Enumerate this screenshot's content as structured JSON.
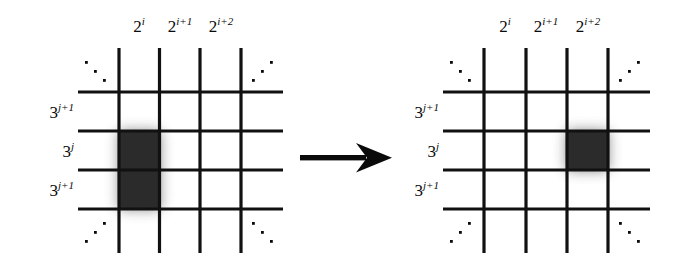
{
  "figure": {
    "caption": "",
    "type": "grid-transformation-diagram",
    "colors": {
      "ink": "#0a0a0a",
      "line": "#111111",
      "shaded_cell": "#2b2b2b",
      "background": "#ffffff"
    }
  },
  "arrow": {
    "name": "rightwards-transformation-arrow",
    "direction": "right",
    "label": ""
  },
  "panels": [
    {
      "id": "left",
      "name": "before-grid",
      "column_labels": [
        {
          "base": "2",
          "exp": "i",
          "text": "2^i"
        },
        {
          "base": "2",
          "exp": "i+1",
          "text": "2^{i+1}"
        },
        {
          "base": "2",
          "exp": "i+2",
          "text": "2^{i+2}"
        }
      ],
      "row_labels": [
        {
          "base": "3",
          "exp": "j+1",
          "text": "3^{j+1}"
        },
        {
          "base": "3",
          "exp": "j",
          "text": "3^{j}"
        },
        {
          "base": "3",
          "exp": "j+1",
          "text": "3^{j+1}"
        }
      ],
      "corner_ellipses": [
        {
          "position": "top-left",
          "slope": "down-right"
        },
        {
          "position": "top-right",
          "slope": "up-right"
        },
        {
          "position": "bottom-left",
          "slope": "up-right"
        },
        {
          "position": "bottom-right",
          "slope": "down-right"
        }
      ],
      "shaded_region": {
        "name": "shaded-cells-before",
        "columns": 1,
        "rows": 2,
        "column_index": 0,
        "row_index": 1,
        "description": "tall block spanning one column and two rows"
      }
    },
    {
      "id": "right",
      "name": "after-grid",
      "column_labels": [
        {
          "base": "2",
          "exp": "i",
          "text": "2^i"
        },
        {
          "base": "2",
          "exp": "i+1",
          "text": "2^{i+1}"
        },
        {
          "base": "2",
          "exp": "i+2",
          "text": "2^{i+2}"
        }
      ],
      "row_labels": [
        {
          "base": "3",
          "exp": "j+1",
          "text": "3^{j+1}"
        },
        {
          "base": "3",
          "exp": "j",
          "text": "3^{j}"
        },
        {
          "base": "3",
          "exp": "j+1",
          "text": "3^{j+1}"
        }
      ],
      "corner_ellipses": [
        {
          "position": "top-left",
          "slope": "down-right"
        },
        {
          "position": "top-right",
          "slope": "up-right"
        },
        {
          "position": "bottom-left",
          "slope": "up-right"
        },
        {
          "position": "bottom-right",
          "slope": "down-right"
        }
      ],
      "shaded_region": {
        "name": "shaded-cells-after",
        "columns": 1,
        "rows": 1,
        "column_index": 2,
        "row_index": 1,
        "description": "single square cell in the third column, middle row"
      }
    }
  ]
}
